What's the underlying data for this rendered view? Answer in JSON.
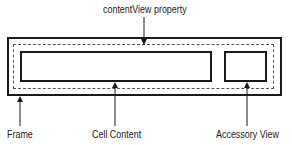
{
  "diagram": {
    "type": "table-view-cell-anatomy",
    "labels": {
      "content_view": "contentView property",
      "frame": "Frame",
      "cell_content": "Cell Content",
      "accessory_view": "Accessory View"
    },
    "colors": {
      "stroke": "#1a1a1a",
      "dashed": "#555555",
      "background": "#ffffff"
    }
  }
}
